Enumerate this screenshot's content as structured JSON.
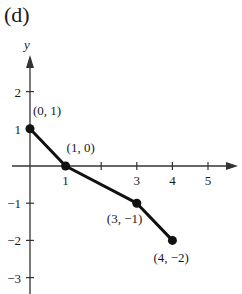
{
  "panel_label": "(d)",
  "chart_data": {
    "type": "line",
    "title": "",
    "xlabel": "",
    "ylabel": "y",
    "x": [
      0,
      1,
      3,
      4
    ],
    "series": [
      {
        "name": "piecewise",
        "values": [
          1,
          0,
          -1,
          -2
        ]
      }
    ],
    "points": [
      {
        "x": 0,
        "y": 1,
        "label": "(0, 1)"
      },
      {
        "x": 1,
        "y": 0,
        "label": "(1, 0)"
      },
      {
        "x": 3,
        "y": -1,
        "label": "(3, −1)"
      },
      {
        "x": 4,
        "y": -2,
        "label": "(4, −2)"
      }
    ],
    "x_ticks": [
      1,
      2,
      3,
      4,
      5
    ],
    "x_tick_labels": [
      "1",
      "",
      "3",
      "4",
      "5"
    ],
    "y_ticks": [
      2,
      1,
      -1,
      -2,
      -3
    ],
    "y_tick_labels": [
      "2",
      "1",
      "−1",
      "−2",
      "−3"
    ],
    "xlim": [
      -0.8,
      5.8
    ],
    "ylim": [
      -3.4,
      2.9
    ],
    "grid": false,
    "legend": "none"
  }
}
